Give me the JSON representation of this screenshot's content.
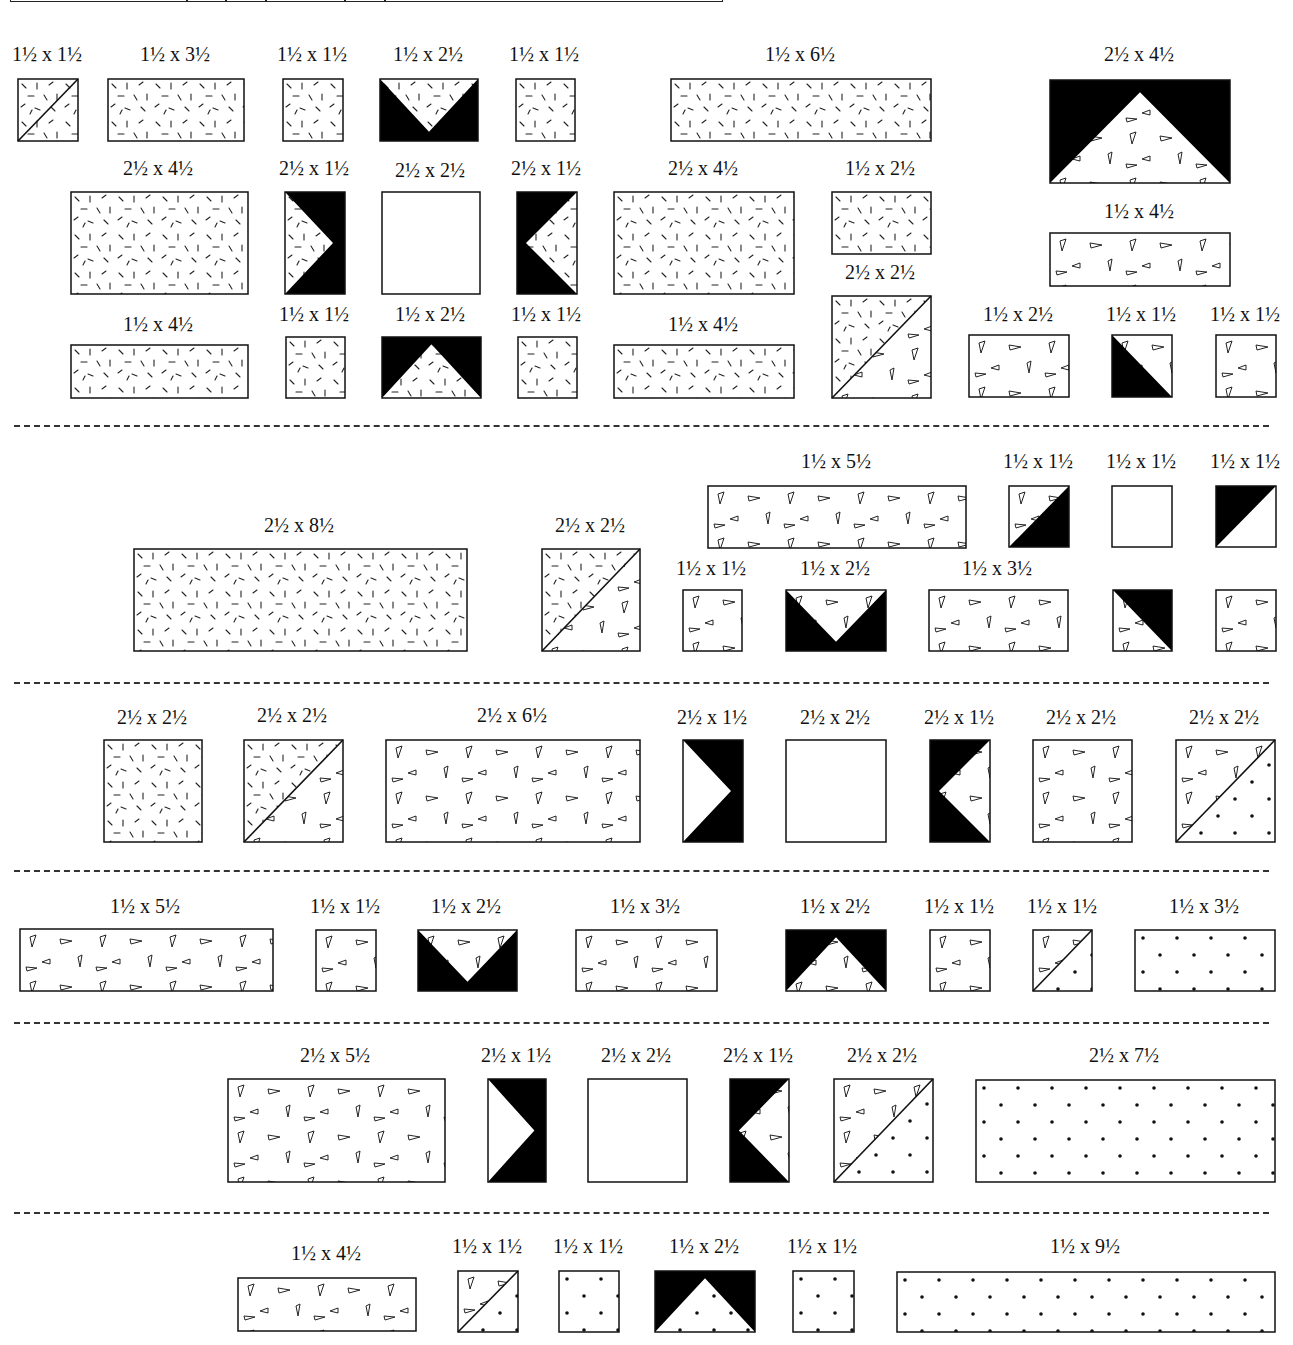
{
  "diagram": {
    "units": "inches",
    "top_bar_ticks": [
      175,
      214,
      254,
      333,
      373
    ],
    "separators_y": [
      425,
      682,
      870,
      1022,
      1212
    ],
    "fabric_legend": {
      "dash": "scattered dash print",
      "tri": "small triangle print",
      "dot": "dot print",
      "black": "solid black",
      "plain": "plain white"
    },
    "pieces": [
      {
        "id": "p1",
        "label": "1½ x 1½",
        "x": 17,
        "y": 78,
        "w": 60,
        "h": 62,
        "fill": "dash",
        "shape": "diag-line-br"
      },
      {
        "id": "p2",
        "label": "1½ x 3½",
        "x": 107,
        "y": 78,
        "w": 136,
        "h": 62,
        "fill": "dash",
        "shape": "rect"
      },
      {
        "id": "p3",
        "label": "1½ x 1½",
        "x": 282,
        "y": 78,
        "w": 60,
        "h": 62,
        "fill": "dash",
        "shape": "rect"
      },
      {
        "id": "p4",
        "label": "1½ x 2½",
        "x": 379,
        "y": 78,
        "w": 98,
        "h": 62,
        "fill": "dash",
        "shape": "v-down"
      },
      {
        "id": "p5",
        "label": "1½ x 1½",
        "x": 515,
        "y": 78,
        "w": 59,
        "h": 62,
        "fill": "dash",
        "shape": "rect"
      },
      {
        "id": "p6",
        "label": "1½ x 6½",
        "x": 670,
        "y": 78,
        "w": 260,
        "h": 62,
        "fill": "dash",
        "shape": "rect"
      },
      {
        "id": "p7",
        "label": "2½ x 4½",
        "x": 1049,
        "y": 79,
        "w": 180,
        "h": 103,
        "fill": "tri",
        "shape": "peak-up"
      },
      {
        "id": "p8",
        "label": "2½ x 4½",
        "x": 70,
        "y": 191,
        "w": 177,
        "h": 102,
        "fill": "dash",
        "shape": "rect"
      },
      {
        "id": "p9",
        "label": "2½ x 1½",
        "x": 284,
        "y": 191,
        "w": 60,
        "h": 102,
        "fill": "dash",
        "shape": "arrow-right"
      },
      {
        "id": "p10",
        "label": "2½ x 2½",
        "x": 381,
        "y": 191,
        "w": 98,
        "h": 102,
        "fill": "plain",
        "shape": "rect"
      },
      {
        "id": "p11",
        "label": "2½ x 1½",
        "x": 516,
        "y": 191,
        "w": 60,
        "h": 102,
        "fill": "dash",
        "shape": "arrow-left"
      },
      {
        "id": "p12",
        "label": "2½ x 4½",
        "x": 613,
        "y": 191,
        "w": 180,
        "h": 102,
        "fill": "dash",
        "shape": "rect"
      },
      {
        "id": "p13",
        "label": "1½ x 2½",
        "x": 831,
        "y": 191,
        "w": 99,
        "h": 62,
        "fill": "dash",
        "shape": "rect"
      },
      {
        "id": "p14",
        "label": "1½ x 4½",
        "x": 1049,
        "y": 232,
        "w": 180,
        "h": 53,
        "fill": "tri",
        "shape": "rect"
      },
      {
        "id": "p15",
        "label": "1½ x 4½",
        "x": 70,
        "y": 344,
        "w": 177,
        "h": 53,
        "fill": "dash",
        "shape": "rect"
      },
      {
        "id": "p16",
        "label": "1½ x 1½",
        "x": 285,
        "y": 336,
        "w": 59,
        "h": 61,
        "fill": "dash",
        "shape": "rect"
      },
      {
        "id": "p17",
        "label": "1½ x 2½",
        "x": 381,
        "y": 336,
        "w": 99,
        "h": 61,
        "fill": "dash",
        "shape": "peak-up"
      },
      {
        "id": "p18",
        "label": "1½ x 1½",
        "x": 517,
        "y": 336,
        "w": 59,
        "h": 61,
        "fill": "dash",
        "shape": "rect"
      },
      {
        "id": "p19",
        "label": "1½ x 4½",
        "x": 613,
        "y": 344,
        "w": 180,
        "h": 53,
        "fill": "dash",
        "shape": "rect"
      },
      {
        "id": "p20",
        "label": "2½ x 2½",
        "x": 831,
        "y": 295,
        "w": 99,
        "h": 102,
        "fill": "split-dash-tri",
        "shape": "diag-line-bl-tr"
      },
      {
        "id": "p21",
        "label": "1½ x 2½",
        "x": 968,
        "y": 334,
        "w": 100,
        "h": 62,
        "fill": "tri",
        "shape": "rect"
      },
      {
        "id": "p22",
        "label": "1½ x 1½",
        "x": 1111,
        "y": 334,
        "w": 60,
        "h": 62,
        "fill": "tri",
        "shape": "half-black-bl"
      },
      {
        "id": "p23",
        "label": "1½ x 1½",
        "x": 1215,
        "y": 334,
        "w": 60,
        "h": 62,
        "fill": "tri",
        "shape": "rect"
      },
      {
        "id": "p24",
        "label": "2½ x 8½",
        "x": 133,
        "y": 548,
        "w": 333,
        "h": 102,
        "fill": "dash",
        "shape": "rect"
      },
      {
        "id": "p25",
        "label": "2½ x 2½",
        "x": 541,
        "y": 548,
        "w": 98,
        "h": 102,
        "fill": "split-dash-tri",
        "shape": "diag-line-bl-tr"
      },
      {
        "id": "p26",
        "label": "1½ x 5½",
        "x": 707,
        "y": 485,
        "w": 258,
        "h": 62,
        "fill": "tri",
        "shape": "rect"
      },
      {
        "id": "p27",
        "label": "1½ x 1½",
        "x": 1008,
        "y": 485,
        "w": 60,
        "h": 61,
        "fill": "tri",
        "shape": "half-black-br"
      },
      {
        "id": "p28",
        "label": "1½ x 1½",
        "x": 1111,
        "y": 485,
        "w": 60,
        "h": 61,
        "fill": "plain",
        "shape": "rect"
      },
      {
        "id": "p29",
        "label": "1½ x 1½",
        "x": 1215,
        "y": 485,
        "w": 60,
        "h": 61,
        "fill": "plain",
        "shape": "half-black-tl"
      },
      {
        "id": "p30",
        "label": "1½ x 1½",
        "x": 682,
        "y": 589,
        "w": 59,
        "h": 61,
        "fill": "tri",
        "shape": "rect"
      },
      {
        "id": "p31",
        "label": "1½ x 2½",
        "x": 785,
        "y": 589,
        "w": 100,
        "h": 61,
        "fill": "tri",
        "shape": "v-down"
      },
      {
        "id": "p32",
        "label": "1½ x 3½",
        "x": 928,
        "y": 589,
        "w": 139,
        "h": 61,
        "fill": "tri",
        "shape": "rect"
      },
      {
        "id": "p33",
        "label": "",
        "x": 1112,
        "y": 589,
        "w": 59,
        "h": 61,
        "fill": "tri",
        "shape": "half-black-tr"
      },
      {
        "id": "p34",
        "label": "",
        "x": 1215,
        "y": 589,
        "w": 60,
        "h": 61,
        "fill": "tri",
        "shape": "rect"
      },
      {
        "id": "p35",
        "label": "2½ x 2½",
        "x": 103,
        "y": 739,
        "w": 98,
        "h": 102,
        "fill": "dash",
        "shape": "rect"
      },
      {
        "id": "p36",
        "label": "2½ x 2½",
        "x": 243,
        "y": 739,
        "w": 99,
        "h": 102,
        "fill": "split-dash-tri",
        "shape": "diag-line-bl-tr"
      },
      {
        "id": "p37",
        "label": "2½ x 6½",
        "x": 385,
        "y": 739,
        "w": 254,
        "h": 102,
        "fill": "tri",
        "shape": "rect"
      },
      {
        "id": "p38",
        "label": "2½ x 1½",
        "x": 682,
        "y": 739,
        "w": 60,
        "h": 102,
        "fill": "plain",
        "shape": "arrow-right"
      },
      {
        "id": "p39",
        "label": "2½ x 2½",
        "x": 785,
        "y": 739,
        "w": 100,
        "h": 102,
        "fill": "plain",
        "shape": "rect"
      },
      {
        "id": "p40",
        "label": "2½ x 1½",
        "x": 929,
        "y": 739,
        "w": 60,
        "h": 102,
        "fill": "tri",
        "shape": "arrow-left"
      },
      {
        "id": "p41",
        "label": "2½ x 2½",
        "x": 1032,
        "y": 739,
        "w": 99,
        "h": 102,
        "fill": "tri",
        "shape": "rect"
      },
      {
        "id": "p42",
        "label": "2½ x 2½",
        "x": 1175,
        "y": 739,
        "w": 99,
        "h": 102,
        "fill": "split-tri-dot",
        "shape": "diag-line-bl-tr"
      },
      {
        "id": "p43",
        "label": "1½ x 5½",
        "x": 19,
        "y": 928,
        "w": 253,
        "h": 62,
        "fill": "tri",
        "shape": "rect"
      },
      {
        "id": "p44",
        "label": "1½ x 1½",
        "x": 315,
        "y": 929,
        "w": 60,
        "h": 61,
        "fill": "tri",
        "shape": "rect"
      },
      {
        "id": "p45",
        "label": "1½ x 2½",
        "x": 417,
        "y": 929,
        "w": 99,
        "h": 61,
        "fill": "tri",
        "shape": "v-down"
      },
      {
        "id": "p46",
        "label": "1½ x 3½",
        "x": 575,
        "y": 929,
        "w": 141,
        "h": 61,
        "fill": "tri",
        "shape": "rect"
      },
      {
        "id": "p47",
        "label": "1½ x 2½",
        "x": 785,
        "y": 929,
        "w": 100,
        "h": 61,
        "fill": "tri",
        "shape": "peak-up"
      },
      {
        "id": "p48",
        "label": "1½ x 1½",
        "x": 929,
        "y": 929,
        "w": 60,
        "h": 61,
        "fill": "tri",
        "shape": "rect"
      },
      {
        "id": "p49",
        "label": "1½ x 1½",
        "x": 1032,
        "y": 929,
        "w": 59,
        "h": 61,
        "fill": "split-tri-dot",
        "shape": "diag-line-bl-tr"
      },
      {
        "id": "p50",
        "label": "1½ x 3½",
        "x": 1134,
        "y": 929,
        "w": 140,
        "h": 61,
        "fill": "dot",
        "shape": "rect"
      },
      {
        "id": "p51",
        "label": "2½ x 5½",
        "x": 227,
        "y": 1078,
        "w": 217,
        "h": 103,
        "fill": "tri",
        "shape": "rect"
      },
      {
        "id": "p52",
        "label": "2½ x 1½",
        "x": 487,
        "y": 1078,
        "w": 58,
        "h": 103,
        "fill": "plain",
        "shape": "arrow-right"
      },
      {
        "id": "p53",
        "label": "2½ x 2½",
        "x": 587,
        "y": 1078,
        "w": 99,
        "h": 103,
        "fill": "plain",
        "shape": "rect"
      },
      {
        "id": "p54",
        "label": "2½ x 1½",
        "x": 729,
        "y": 1078,
        "w": 59,
        "h": 103,
        "fill": "tri",
        "shape": "arrow-left"
      },
      {
        "id": "p55",
        "label": "2½ x 2½",
        "x": 833,
        "y": 1078,
        "w": 99,
        "h": 103,
        "fill": "split-tri-dot",
        "shape": "diag-line-bl-tr"
      },
      {
        "id": "p56",
        "label": "2½ x 7½",
        "x": 975,
        "y": 1079,
        "w": 299,
        "h": 102,
        "fill": "dot",
        "shape": "rect"
      },
      {
        "id": "p57",
        "label": "1½ x 4½",
        "x": 237,
        "y": 1277,
        "w": 178,
        "h": 53,
        "fill": "tri",
        "shape": "rect"
      },
      {
        "id": "p58",
        "label": "1½ x 1½",
        "x": 457,
        "y": 1270,
        "w": 60,
        "h": 61,
        "fill": "split-tri-dot",
        "shape": "diag-line-bl-tr"
      },
      {
        "id": "p59",
        "label": "1½ x 1½",
        "x": 558,
        "y": 1270,
        "w": 60,
        "h": 61,
        "fill": "dot",
        "shape": "rect"
      },
      {
        "id": "p60",
        "label": "1½ x 2½",
        "x": 654,
        "y": 1270,
        "w": 100,
        "h": 61,
        "fill": "dot",
        "shape": "peak-up"
      },
      {
        "id": "p61",
        "label": "1½ x 1½",
        "x": 792,
        "y": 1270,
        "w": 61,
        "h": 61,
        "fill": "dot",
        "shape": "rect"
      },
      {
        "id": "p62",
        "label": "1½ x 9½",
        "x": 896,
        "y": 1271,
        "w": 378,
        "h": 60,
        "fill": "dot",
        "shape": "rect"
      }
    ],
    "label_positions": {
      "p1": [
        47,
        46
      ],
      "p2": [
        175,
        46
      ],
      "p3": [
        312,
        46
      ],
      "p4": [
        428,
        46
      ],
      "p5": [
        544,
        46
      ],
      "p6": [
        800,
        46
      ],
      "p7": [
        1139,
        46
      ],
      "p8": [
        158,
        160
      ],
      "p9": [
        314,
        160
      ],
      "p10": [
        430,
        162
      ],
      "p11": [
        546,
        160
      ],
      "p12": [
        703,
        160
      ],
      "p13": [
        880,
        160
      ],
      "p14": [
        1139,
        203
      ],
      "p15": [
        158,
        316
      ],
      "p16": [
        314,
        306
      ],
      "p17": [
        430,
        306
      ],
      "p18": [
        546,
        306
      ],
      "p19": [
        703,
        316
      ],
      "p20": [
        880,
        264
      ],
      "p21": [
        1018,
        306
      ],
      "p22": [
        1141,
        306
      ],
      "p23": [
        1245,
        306
      ],
      "p24": [
        299,
        517
      ],
      "p25": [
        590,
        517
      ],
      "p26": [
        836,
        453
      ],
      "p27": [
        1038,
        453
      ],
      "p28": [
        1141,
        453
      ],
      "p29": [
        1245,
        453
      ],
      "p30": [
        711,
        560
      ],
      "p31": [
        835,
        560
      ],
      "p32": [
        997,
        560
      ],
      "p35": [
        152,
        709
      ],
      "p36": [
        292,
        707
      ],
      "p37": [
        512,
        707
      ],
      "p38": [
        712,
        709
      ],
      "p39": [
        835,
        709
      ],
      "p40": [
        959,
        709
      ],
      "p41": [
        1081,
        709
      ],
      "p42": [
        1224,
        709
      ],
      "p43": [
        145,
        898
      ],
      "p44": [
        345,
        898
      ],
      "p45": [
        466,
        898
      ],
      "p46": [
        645,
        898
      ],
      "p47": [
        835,
        898
      ],
      "p48": [
        959,
        898
      ],
      "p49": [
        1062,
        898
      ],
      "p50": [
        1204,
        898
      ],
      "p51": [
        335,
        1047
      ],
      "p52": [
        516,
        1047
      ],
      "p53": [
        636,
        1047
      ],
      "p54": [
        758,
        1047
      ],
      "p55": [
        882,
        1047
      ],
      "p56": [
        1124,
        1047
      ],
      "p57": [
        326,
        1245
      ],
      "p58": [
        487,
        1238
      ],
      "p59": [
        588,
        1238
      ],
      "p60": [
        704,
        1238
      ],
      "p61": [
        822,
        1238
      ],
      "p62": [
        1085,
        1238
      ]
    }
  }
}
